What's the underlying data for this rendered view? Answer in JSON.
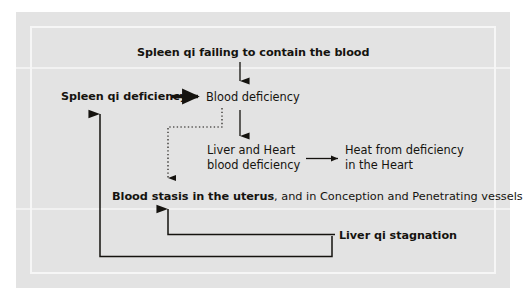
{
  "diagram": {
    "title_note": "Pathology flow chart of blood stasis in the uterus",
    "panel_bg": "#e3e3e3",
    "text_color": "#15130f",
    "nodes": {
      "spleen_qi_failing": "Spleen qi failing to contain the blood",
      "spleen_qi_deficiency": "Spleen qi deficiency",
      "blood_deficiency": "Blood deficiency",
      "liver_heart_blood_deficiency": "Liver and Heart blood deficiency",
      "heat_from_deficiency": "Heat from deficiency in the Heart",
      "blood_stasis_bold": "Blood stasis in the uterus",
      "blood_stasis_rest": ", and in Conception and Penetrating vessels",
      "liver_qi_stagnation": "Liver qi stagnation"
    },
    "edges": [
      {
        "name": "spleen-qi-failing-to-blood-deficiency",
        "from": "Spleen qi failing to contain the blood",
        "to": "Blood deficiency",
        "style": "solid-thin-arrow",
        "direction": "down"
      },
      {
        "name": "spleen-qi-deficiency-to-blood-deficiency",
        "from": "Spleen qi deficiency",
        "to": "Blood deficiency",
        "style": "solid-thick-arrow",
        "direction": "right"
      },
      {
        "name": "blood-deficiency-to-liver-heart",
        "from": "Blood deficiency",
        "to": "Liver and Heart blood deficiency",
        "style": "solid-thin-arrow",
        "direction": "down"
      },
      {
        "name": "blood-deficiency-to-blood-stasis",
        "from": "Blood deficiency",
        "to": "Blood stasis in the uterus",
        "style": "dotted-arrow",
        "direction": "left-then-down"
      },
      {
        "name": "liver-heart-to-heat-from-deficiency",
        "from": "Liver and Heart blood deficiency",
        "to": "Heat from deficiency in the Heart",
        "style": "solid-thin-arrow",
        "direction": "right"
      },
      {
        "name": "liver-qi-stagnation-to-blood-stasis",
        "from": "Liver qi stagnation",
        "to": "Blood stasis in the uterus",
        "style": "solid-arrow",
        "direction": "left-then-up"
      },
      {
        "name": "liver-qi-stagnation-to-spleen-qi-deficiency",
        "from": "Liver qi stagnation",
        "to": "Spleen qi deficiency",
        "style": "solid-arrow",
        "direction": "down-left-then-up"
      }
    ]
  }
}
